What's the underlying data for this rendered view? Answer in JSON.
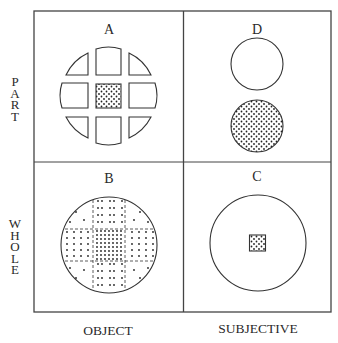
{
  "axes": {
    "row_labels": [
      "PART",
      "WHOLE"
    ],
    "column_labels": [
      "OBJECT",
      "SUBJECTIVE"
    ]
  },
  "quadrants": [
    {
      "id": "A",
      "label": "A",
      "row": "PART",
      "column": "OBJECT",
      "figure": "circle cut into 9 separated pieces, center piece dotted"
    },
    {
      "id": "D",
      "label": "D",
      "row": "PART",
      "column": "SUBJECTIVE",
      "figure": "two circles: one blank, one fully dotted"
    },
    {
      "id": "B",
      "label": "B",
      "row": "WHOLE",
      "column": "OBJECT",
      "figure": "whole circle with dashed grid and dots densest at center"
    },
    {
      "id": "C",
      "label": "C",
      "row": "WHOLE",
      "column": "SUBJECTIVE",
      "figure": "large blank circle with small dotted square at center"
    }
  ],
  "colors": {
    "line": "#333333",
    "dot": "#222222",
    "background": "#ffffff"
  }
}
